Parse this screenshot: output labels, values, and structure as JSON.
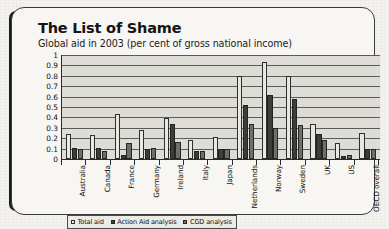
{
  "frame": {
    "title": "The List of Shame",
    "subtitle": "Global aid in 2003 (per cent of gross national income)"
  },
  "legend": {
    "items": [
      {
        "label": "Total aid",
        "swatch": "light-square-icon"
      },
      {
        "label": "Action Aid analysis",
        "swatch": "dark-square-icon"
      },
      {
        "label": "CGD analysis",
        "swatch": "grey-square-icon"
      }
    ]
  },
  "chart_data": {
    "type": "bar",
    "title": "The List of Shame",
    "subtitle": "Global aid in 2003 (per cent of gross national income)",
    "xlabel": "",
    "ylabel": "",
    "ylim": [
      0,
      1
    ],
    "ytick_labels": [
      "1",
      "0.9",
      "0.8",
      "0.7",
      "0.6",
      "0.5",
      "0.4",
      "0.3",
      "0.2",
      "0.1",
      "0"
    ],
    "ytick_values": [
      1,
      0.9,
      0.8,
      0.7,
      0.6,
      0.5,
      0.4,
      0.3,
      0.2,
      0.1,
      0
    ],
    "grid": true,
    "legend_position": "bottom-left",
    "categories": [
      "Australia",
      "Canada",
      "France",
      "Germany",
      "Ireland",
      "Italy",
      "Japan",
      "Netherlands",
      "Norway",
      "Sweden",
      "UK",
      "US",
      "OECD overall"
    ],
    "series": [
      {
        "name": "Total aid",
        "values": [
          0.24,
          0.23,
          0.43,
          0.28,
          0.39,
          0.18,
          0.21,
          0.8,
          0.93,
          0.8,
          0.34,
          0.15,
          0.25
        ]
      },
      {
        "name": "Action Aid analysis",
        "values": [
          0.11,
          0.11,
          0.04,
          0.1,
          0.34,
          0.08,
          0.1,
          0.52,
          0.62,
          0.58,
          0.24,
          0.03,
          0.1
        ]
      },
      {
        "name": "CGD analysis",
        "values": [
          0.1,
          0.08,
          0.15,
          0.11,
          0.16,
          0.08,
          0.1,
          0.34,
          0.3,
          0.33,
          0.18,
          0.04,
          0.1
        ]
      }
    ]
  }
}
